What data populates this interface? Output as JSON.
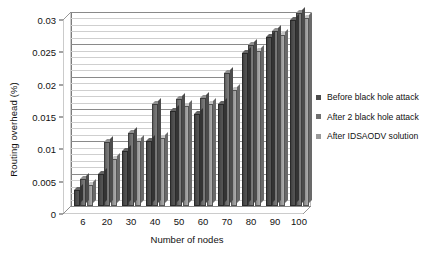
{
  "chart_data": {
    "type": "bar",
    "title": "",
    "subtitle": "",
    "xlabel": "Number of nodes",
    "ylabel": "Routing overhead (%)",
    "categories": [
      "6",
      "20",
      "30",
      "40",
      "50",
      "60",
      "70",
      "80",
      "90",
      "100"
    ],
    "series": [
      {
        "name": "Before black hole attack",
        "color": "#4d4d4d",
        "values": [
          0.0025,
          0.005,
          0.0085,
          0.0101,
          0.0147,
          0.0143,
          0.0157,
          0.0236,
          0.0262,
          0.0287
        ]
      },
      {
        "name": "After 2 black hole attack",
        "color": "#707070",
        "values": [
          0.0042,
          0.0099,
          0.0113,
          0.0157,
          0.0166,
          0.0167,
          0.0206,
          0.0249,
          0.0271,
          0.0299
        ]
      },
      {
        "name": "After IDSAODV solution",
        "color": "#9a9a9a",
        "values": [
          0.0033,
          0.0073,
          0.0101,
          0.0105,
          0.0155,
          0.0157,
          0.0179,
          0.0239,
          0.0265,
          0.029
        ]
      }
    ],
    "ylim": [
      0,
      0.03
    ],
    "yticks": [
      "0",
      "0.005",
      "0.01",
      "0.015",
      "0.02",
      "0.025",
      "0.03"
    ],
    "ytick_values": [
      0,
      0.005,
      0.01,
      0.015,
      0.02,
      0.025,
      0.03
    ],
    "minor_gridline_step": 0.001,
    "grid": true,
    "legend_position": "right"
  },
  "legend": {
    "items": [
      {
        "label": "Before black hole attack",
        "color": "#4d4d4d"
      },
      {
        "label": "After 2 black hole attack",
        "color": "#707070"
      },
      {
        "label": "After IDSAODV solution",
        "color": "#9a9a9a"
      }
    ]
  }
}
